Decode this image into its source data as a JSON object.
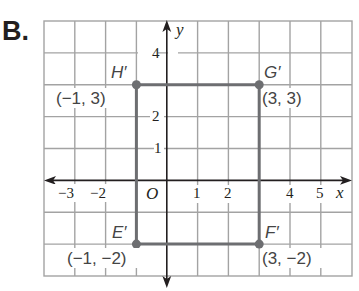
{
  "problem_label": "B.",
  "axes": {
    "x_label": "x",
    "y_label": "y",
    "origin_label": "O",
    "x_ticks": [
      {
        "value": -3,
        "label": "−3"
      },
      {
        "value": -2,
        "label": "−2"
      },
      {
        "value": 1,
        "label": "1"
      },
      {
        "value": 2,
        "label": "2"
      },
      {
        "value": 4,
        "label": "4"
      },
      {
        "value": 5,
        "label": "5"
      }
    ],
    "y_ticks": [
      {
        "value": 4,
        "label": "4"
      },
      {
        "value": 2,
        "label": "2"
      },
      {
        "value": 1,
        "label": "1"
      }
    ],
    "x_range": [
      -4,
      6
    ],
    "y_range": [
      -3,
      5
    ]
  },
  "points": {
    "H": {
      "name": "H′",
      "coord": "(−1, 3)",
      "x": -1,
      "y": 3
    },
    "G": {
      "name": "G′",
      "coord": "(3, 3)",
      "x": 3,
      "y": 3
    },
    "F": {
      "name": "F′",
      "coord": "(3, −2)",
      "x": 3,
      "y": -2
    },
    "E": {
      "name": "E′",
      "coord": "(−1, −2)",
      "x": -1,
      "y": -2
    }
  },
  "colors": {
    "grid": "#9a9a9a",
    "axis": "#231f20",
    "shape": "#6d6e71",
    "text": "#231f20"
  }
}
